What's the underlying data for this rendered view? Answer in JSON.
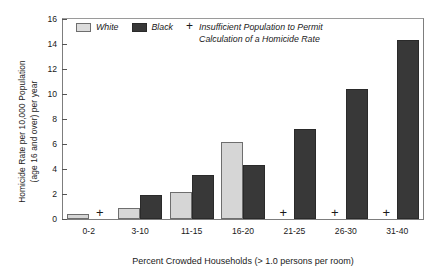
{
  "chart_data": {
    "type": "bar",
    "title": "",
    "xlabel": "Percent Crowded Households (> 1.0 persons per room)",
    "ylabel_line1": "Homicide Rate per 10,000 Population",
    "ylabel_line2": "(age 16 and over) per year",
    "categories": [
      "0-2",
      "3-10",
      "11-15",
      "16-20",
      "21-25",
      "26-30",
      "31-40"
    ],
    "ylim": [
      0,
      16
    ],
    "yticks": [
      0,
      2,
      4,
      6,
      8,
      10,
      12,
      14,
      16
    ],
    "grid": false,
    "legend_position": "top-left-inside",
    "series": [
      {
        "name": "White",
        "color": "#d6d6d6",
        "values": [
          0.4,
          0.9,
          2.2,
          6.2,
          null,
          null,
          null
        ],
        "missing_marker": "+"
      },
      {
        "name": "Black",
        "color": "#383838",
        "values": [
          null,
          1.9,
          3.5,
          4.3,
          7.2,
          10.4,
          14.3
        ],
        "missing_marker": "+"
      }
    ],
    "annotations": {
      "plus_meaning_line1": "Insufficient Population to Permit",
      "plus_meaning_line2": "Calculation of a Homicide Rate",
      "plus_symbol": "+"
    }
  },
  "legend": {
    "white_label": "White",
    "black_label": "Black",
    "plus_symbol": "+",
    "note_line1": "Insufficient Population to Permit",
    "note_line2": "Calculation of a Homicide Rate"
  },
  "axes": {
    "y_title_line1": "Homicide Rate per 10,000 Population",
    "y_title_line2": "(age 16 and over) per year",
    "x_title": "Percent Crowded Households (> 1.0 persons per room)",
    "yticks": [
      "16",
      "14",
      "12",
      "10",
      "8",
      "6",
      "4",
      "2",
      "0"
    ]
  }
}
